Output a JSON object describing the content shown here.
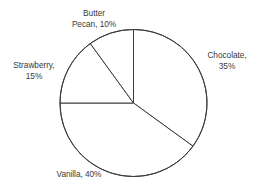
{
  "chart_data": {
    "type": "pie",
    "title": "",
    "subtitle": "",
    "xlabel": "",
    "ylabel": "",
    "grid": false,
    "legend_position": "none",
    "label_format": "{name}, {value}%",
    "start_angle_deg": 0,
    "direction": "clockwise",
    "categories": [
      "Chocolate",
      "Vanilla",
      "Strawberry",
      "Butter Pecan"
    ],
    "values": [
      35,
      40,
      15,
      10
    ],
    "slices": [
      {
        "name": "Chocolate",
        "value": 35,
        "value_text": "35%",
        "label": "Chocolate,\n35%",
        "label_line1": "Chocolate,",
        "label_line2": "35%",
        "color": "#ffffff",
        "stroke": "#3b3b3b",
        "start_deg": 0,
        "end_deg": 126
      },
      {
        "name": "Vanilla",
        "value": 40,
        "value_text": "40%",
        "label": "Vanilla, 40%",
        "label_line1": "Vanilla, 40%",
        "label_line2": "",
        "color": "#ffffff",
        "stroke": "#3b3b3b",
        "start_deg": 126,
        "end_deg": 270
      },
      {
        "name": "Strawberry",
        "value": 15,
        "value_text": "15%",
        "label": "Strawberry,\n15%",
        "label_line1": "Strawberry,",
        "label_line2": "15%",
        "color": "#ffffff",
        "stroke": "#3b3b3b",
        "start_deg": 270,
        "end_deg": 324
      },
      {
        "name": "Butter Pecan",
        "value": 10,
        "value_text": "10%",
        "label": "Butter\nPecan, 10%",
        "label_line1": "Butter",
        "label_line2": "Pecan, 10%",
        "color": "#ffffff",
        "stroke": "#3b3b3b",
        "start_deg": 324,
        "end_deg": 360
      }
    ]
  },
  "labels": {
    "butter_pecan": "Butter\nPecan, 10%",
    "chocolate": "Chocolate,\n35%",
    "strawberry": "Strawberry,\n15%",
    "vanilla": "Vanilla, 40%"
  },
  "style": {
    "background": "#ffffff",
    "line_color": "#3b3b3b",
    "text_color": "#3a3a3a"
  }
}
